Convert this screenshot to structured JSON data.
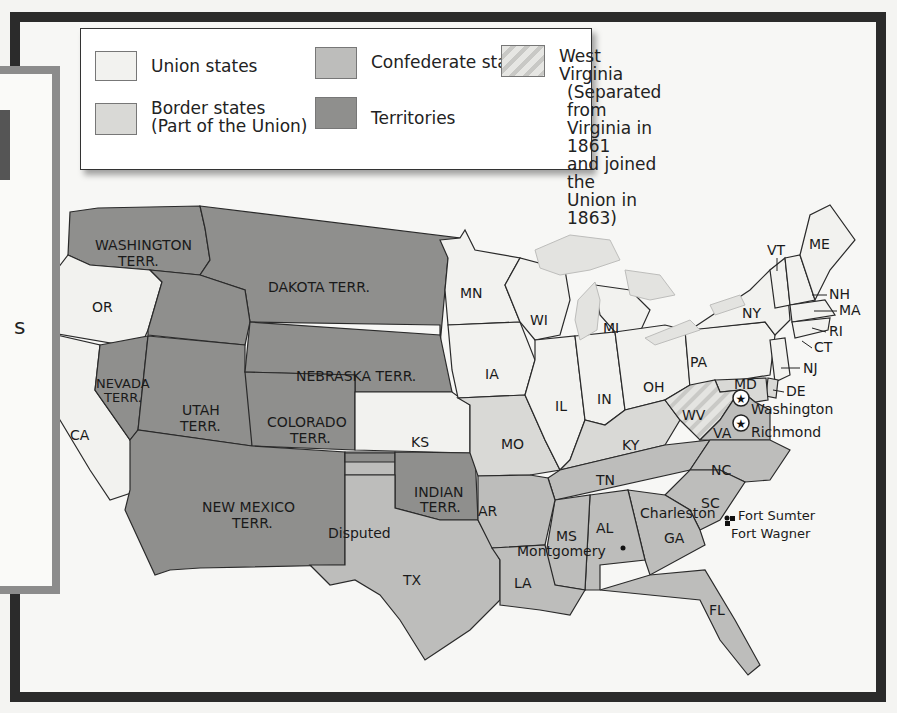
{
  "legend": {
    "items": [
      {
        "key": "union",
        "label": "Union states",
        "color": "#f2f2ef"
      },
      {
        "key": "border",
        "label": "Border states",
        "sublabel": "(Part of the Union)",
        "color": "#d9d9d6"
      },
      {
        "key": "confederate",
        "label": "Confederate states",
        "color": "#bdbdbb"
      },
      {
        "key": "territories",
        "label": "Territories",
        "color": "#8f8f8d"
      },
      {
        "key": "west_virginia",
        "label": "West Virginia",
        "note_lines": [
          "(Separated from",
          "Virginia in 1861",
          "and joined the",
          "Union in 1863)"
        ],
        "pattern": "diagonal-stripes"
      }
    ]
  },
  "side_panel": {
    "visible_fragment": "s"
  },
  "map": {
    "territories": [
      "WASHINGTON TERR.",
      "DAKOTA TERR.",
      "NEVADA TERR.",
      "UTAH TERR.",
      "COLORADO TERR.",
      "NEBRASKA TERR.",
      "NEW MEXICO TERR.",
      "INDIAN TERR."
    ],
    "labels": {
      "washington_terr": [
        "WASHINGTON",
        "TERR."
      ],
      "dakota_terr": "DAKOTA TERR.",
      "nevada_terr": [
        "NEVADA",
        "TERR."
      ],
      "utah_terr": [
        "UTAH",
        "TERR."
      ],
      "colorado_terr": [
        "COLORADO",
        "TERR."
      ],
      "nebraska_terr": "NEBRASKA TERR.",
      "new_mexico_terr": [
        "NEW MEXICO",
        "TERR."
      ],
      "indian_terr": [
        "INDIAN",
        "TERR."
      ],
      "or": "OR",
      "ca": "CA",
      "ks": "KS",
      "mn": "MN",
      "wi": "WI",
      "mi": "MI",
      "ia": "IA",
      "il": "IL",
      "in": "IN",
      "oh": "OH",
      "pa": "PA",
      "ny": "NY",
      "vt": "VT",
      "me": "ME",
      "nh": "NH",
      "ma": "MA",
      "ri": "RI",
      "ct": "CT",
      "nj": "NJ",
      "de": "DE",
      "md": "MD",
      "wv": "WV",
      "va": "VA",
      "ky": "KY",
      "mo": "MO",
      "nc": "NC",
      "tn": "TN",
      "sc": "SC",
      "ar": "AR",
      "ms": "MS",
      "al": "AL",
      "ga": "GA",
      "la": "LA",
      "tx": "TX",
      "fl": "FL",
      "disputed": "Disputed"
    },
    "cities": {
      "washington": "Washington",
      "richmond": "Richmond",
      "montgomery": "Montgomery",
      "charleston": "Charleston",
      "fort_sumter": "Fort Sumter",
      "fort_wagner": "Fort Wagner"
    }
  }
}
